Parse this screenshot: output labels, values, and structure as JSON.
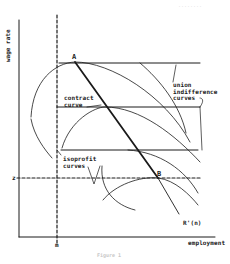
{
  "figure": {
    "axes": {
      "y_label": "wage rate",
      "x_label": "employment",
      "x_marker": "m",
      "y_marker": "z"
    },
    "points": {
      "a": "A",
      "b": "B"
    },
    "labels": {
      "contract_curve": "contract\ncurve",
      "union_indifference": "union\nindifference\ncurves",
      "isoprofit": "isoprofit\ncurves",
      "labor_demand": "R'(n)"
    },
    "caption": "Figure 1",
    "corner_text": "........"
  },
  "colors": {
    "ink": "#1a1a1a",
    "background": "#ffffff",
    "faint": "#c8c8c8"
  }
}
